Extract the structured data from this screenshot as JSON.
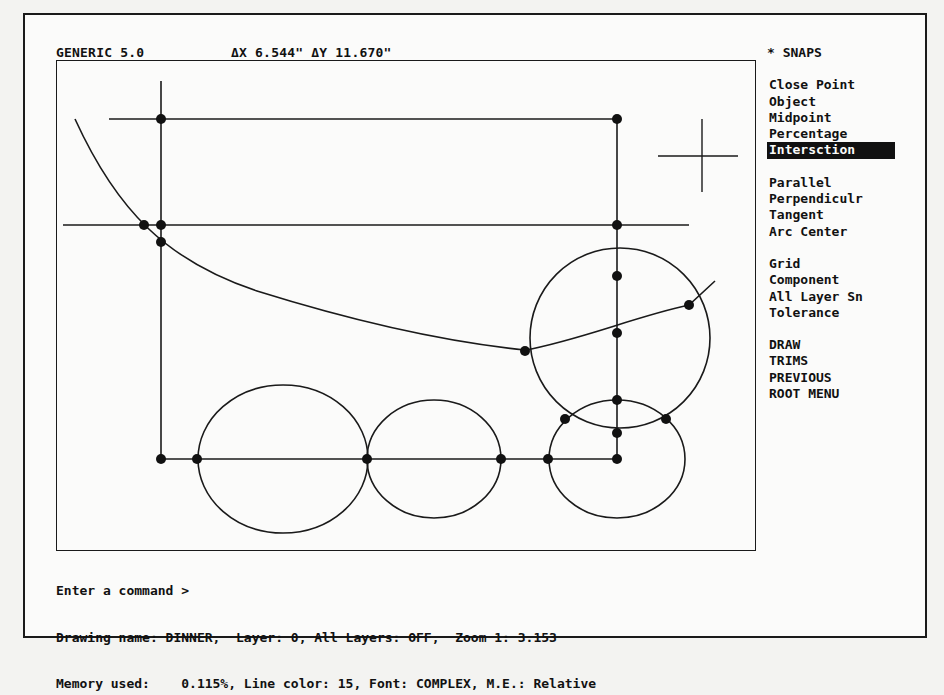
{
  "header": {
    "app_title": "GENERIC 5.0",
    "delta_readout": "ΔX 6.544\"  ΔY 11.670\""
  },
  "snaps_menu": {
    "title": "* SNAPS",
    "groups": [
      {
        "items": [
          {
            "label": "Close Point",
            "selected": false
          },
          {
            "label": "Object",
            "selected": false
          },
          {
            "label": "Midpoint",
            "selected": false
          },
          {
            "label": "Percentage",
            "selected": false
          },
          {
            "label": "Intersction",
            "selected": true
          }
        ]
      },
      {
        "items": [
          {
            "label": "Parallel",
            "selected": false
          },
          {
            "label": "Perpendiculr",
            "selected": false
          },
          {
            "label": "Tangent",
            "selected": false
          },
          {
            "label": "Arc Center",
            "selected": false
          }
        ]
      },
      {
        "items": [
          {
            "label": "Grid",
            "selected": false
          },
          {
            "label": "Component",
            "selected": false
          },
          {
            "label": "All Layer Sn",
            "selected": false
          },
          {
            "label": "Tolerance",
            "selected": false
          }
        ]
      },
      {
        "items": [
          {
            "label": "DRAW",
            "selected": false
          },
          {
            "label": "TRIMS",
            "selected": false
          },
          {
            "label": "PREVIOUS",
            "selected": false
          },
          {
            "label": "ROOT MENU",
            "selected": false
          }
        ]
      }
    ]
  },
  "command_area": {
    "prompt": "Enter a command >",
    "status_line_1": "Drawing name: DINNER,  Layer: 0, All Layers: OFF,  Zoom 1: 3.153",
    "status_line_2": "Memory used:    0.115%, Line color: 15, Font: COMPLEX, M.E.: Relative"
  },
  "drawing": {
    "cursor_icon": "crosshair-cursor",
    "line_color": "#1a1a1a",
    "background": "#fbfbfa",
    "snap_point_count": 19
  }
}
